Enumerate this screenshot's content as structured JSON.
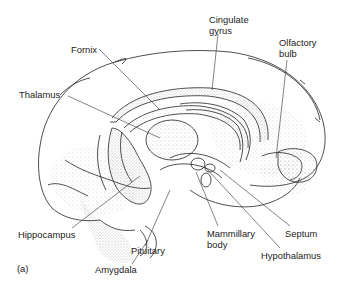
{
  "figure": {
    "panel_label": "(a)"
  },
  "labels": [
    {
      "id": "fornix",
      "text": "Fornix",
      "x": 71,
      "y": 44
    },
    {
      "id": "thalamus",
      "text": "Thalamus",
      "x": 19,
      "y": 89
    },
    {
      "id": "cingulate-gyrus",
      "text": "Cingulate\ngyrus",
      "x": 209,
      "y": 14
    },
    {
      "id": "olfactory-bulb",
      "text": "Olfactory\nbulb",
      "x": 279,
      "y": 37
    },
    {
      "id": "hippocampus",
      "text": "Hippocampus",
      "x": 18,
      "y": 229
    },
    {
      "id": "pituitary",
      "text": "Pituitary",
      "x": 131,
      "y": 245
    },
    {
      "id": "amygdala",
      "text": "Amygdala",
      "x": 95,
      "y": 264
    },
    {
      "id": "mammillary-body",
      "text": "Mammillary\nbody",
      "x": 207,
      "y": 228
    },
    {
      "id": "septum",
      "text": "Septum",
      "x": 285,
      "y": 228
    },
    {
      "id": "hypothalamus",
      "text": "Hypothalamus",
      "x": 261,
      "y": 250
    }
  ],
  "colors": {
    "ink": "#222222",
    "stipple": "#9a9a9a",
    "background": "#ffffff"
  }
}
